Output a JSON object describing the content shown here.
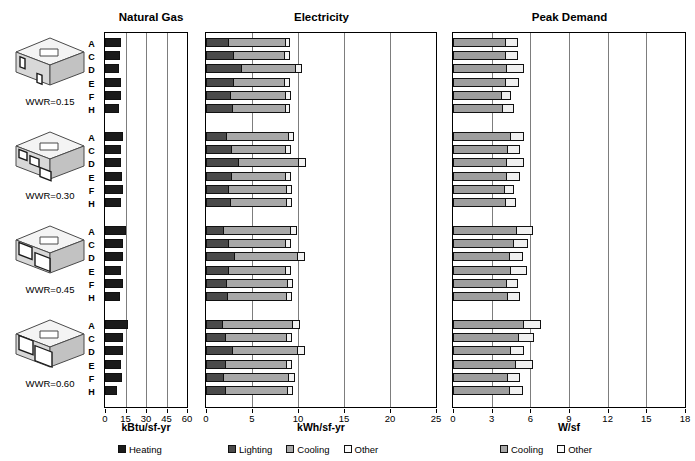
{
  "top_cropped_text": "",
  "panels": [
    {
      "id": "natural_gas",
      "title": "Natural Gas",
      "unit": "kBtu/sf-yr"
    },
    {
      "id": "electricity",
      "title": "Electricity",
      "unit": "kWh/sf-yr"
    },
    {
      "id": "peak_demand",
      "title": "Peak Demand",
      "unit": "W/sf"
    }
  ],
  "row_letters": [
    "A",
    "C",
    "D",
    "E",
    "F",
    "H"
  ],
  "groups": [
    {
      "wwr_label": "WWR=0.15",
      "wwr": 0.15
    },
    {
      "wwr_label": "WWR=0.30",
      "wwr": 0.3
    },
    {
      "wwr_label": "WWR=0.45",
      "wwr": 0.45
    },
    {
      "wwr_label": "WWR=0.60",
      "wwr": 0.6
    }
  ],
  "legends": {
    "natural_gas": [
      {
        "label": "Heating",
        "key": "heating"
      }
    ],
    "electricity": [
      {
        "label": "Lighting",
        "key": "lighting"
      },
      {
        "label": "Cooling",
        "key": "cooling"
      },
      {
        "label": "Other",
        "key": "other"
      }
    ],
    "peak_demand": [
      {
        "label": "Cooling",
        "key": "cooling"
      },
      {
        "label": "Other",
        "key": "other"
      }
    ]
  },
  "chart_data": [
    {
      "type": "bar",
      "orientation": "horizontal",
      "stacked": true,
      "title": "Natural Gas",
      "xlabel": "kBtu/sf-yr",
      "ylabel": "",
      "xlim": [
        0,
        60
      ],
      "xticks": [
        0,
        15,
        30,
        45,
        60
      ],
      "grid": true,
      "legend": [
        "Heating"
      ],
      "legend_position": "bottom",
      "group_labels": [
        "WWR=0.15",
        "WWR=0.30",
        "WWR=0.45",
        "WWR=0.60"
      ],
      "categories": [
        "A",
        "C",
        "D",
        "E",
        "F",
        "H"
      ],
      "series": [
        {
          "name": "Heating",
          "groups": [
            {
              "group": "WWR=0.15",
              "values": [
                11.5,
                11.0,
                10.5,
                11.5,
                11.5,
                10.0
              ]
            },
            {
              "group": "WWR=0.30",
              "values": [
                13.0,
                12.0,
                11.5,
                12.5,
                13.0,
                11.5
              ]
            },
            {
              "group": "WWR=0.45",
              "values": [
                15.5,
                13.5,
                13.0,
                12.0,
                13.5,
                11.0
              ]
            },
            {
              "group": "WWR=0.60",
              "values": [
                16.5,
                13.5,
                13.0,
                12.0,
                12.5,
                9.0
              ]
            }
          ]
        }
      ]
    },
    {
      "type": "bar",
      "orientation": "horizontal",
      "stacked": true,
      "title": "Electricity",
      "xlabel": "kWh/sf-yr",
      "ylabel": "",
      "xlim": [
        0,
        25
      ],
      "xticks": [
        0,
        5,
        10,
        15,
        20,
        25
      ],
      "grid": true,
      "legend": [
        "Lighting",
        "Cooling",
        "Other"
      ],
      "legend_position": "bottom",
      "group_labels": [
        "WWR=0.15",
        "WWR=0.30",
        "WWR=0.45",
        "WWR=0.60"
      ],
      "categories": [
        "A",
        "C",
        "D",
        "E",
        "F",
        "H"
      ],
      "series": [
        {
          "name": "Lighting",
          "groups": [
            {
              "group": "WWR=0.15",
              "values": [
                2.5,
                3.0,
                3.9,
                3.0,
                2.7,
                2.9
              ]
            },
            {
              "group": "WWR=0.30",
              "values": [
                2.3,
                2.8,
                3.6,
                2.8,
                2.5,
                2.7
              ]
            },
            {
              "group": "WWR=0.45",
              "values": [
                2.0,
                2.5,
                3.2,
                2.5,
                2.3,
                2.4
              ]
            },
            {
              "group": "WWR=0.60",
              "values": [
                1.8,
                2.2,
                2.9,
                2.2,
                2.0,
                2.2
              ]
            }
          ]
        },
        {
          "name": "Cooling",
          "groups": [
            {
              "group": "WWR=0.15",
              "values": [
                6.3,
                5.7,
                6.0,
                5.7,
                6.1,
                5.9
              ]
            },
            {
              "group": "WWR=0.30",
              "values": [
                6.8,
                6.0,
                6.6,
                6.0,
                6.4,
                6.2
              ]
            },
            {
              "group": "WWR=0.45",
              "values": [
                7.3,
                6.3,
                6.9,
                6.3,
                6.7,
                6.5
              ]
            },
            {
              "group": "WWR=0.60",
              "values": [
                7.8,
                6.7,
                7.2,
                6.7,
                7.1,
                6.8
              ]
            }
          ]
        },
        {
          "name": "Other",
          "groups": [
            {
              "group": "WWR=0.15",
              "values": [
                0.6,
                0.7,
                0.8,
                0.7,
                0.7,
                0.6
              ]
            },
            {
              "group": "WWR=0.30",
              "values": [
                0.7,
                0.7,
                0.9,
                0.7,
                0.7,
                0.7
              ]
            },
            {
              "group": "WWR=0.45",
              "values": [
                0.8,
                0.7,
                0.9,
                0.7,
                0.7,
                0.7
              ]
            },
            {
              "group": "WWR=0.60",
              "values": [
                0.8,
                0.7,
                0.9,
                0.7,
                0.8,
                0.7
              ]
            }
          ]
        }
      ]
    },
    {
      "type": "bar",
      "orientation": "horizontal",
      "stacked": true,
      "title": "Peak Demand",
      "xlabel": "W/sf",
      "ylabel": "",
      "xlim": [
        0,
        18
      ],
      "xticks": [
        0,
        3,
        6,
        9,
        12,
        15,
        18
      ],
      "grid": true,
      "legend": [
        "Cooling",
        "Other"
      ],
      "legend_position": "bottom",
      "group_labels": [
        "WWR=0.15",
        "WWR=0.30",
        "WWR=0.45",
        "WWR=0.60"
      ],
      "categories": [
        "A",
        "C",
        "D",
        "E",
        "F",
        "H"
      ],
      "series": [
        {
          "name": "Cooling",
          "groups": [
            {
              "group": "WWR=0.15",
              "values": [
                4.1,
                4.1,
                4.2,
                4.1,
                3.8,
                3.9
              ]
            },
            {
              "group": "WWR=0.30",
              "values": [
                4.5,
                4.3,
                4.2,
                4.2,
                4.0,
                4.1
              ]
            },
            {
              "group": "WWR=0.45",
              "values": [
                5.0,
                4.7,
                4.4,
                4.5,
                4.2,
                4.3
              ]
            },
            {
              "group": "WWR=0.60",
              "values": [
                5.5,
                5.1,
                4.5,
                4.9,
                4.3,
                4.4
              ]
            }
          ]
        },
        {
          "name": "Other",
          "groups": [
            {
              "group": "WWR=0.15",
              "values": [
                1.0,
                1.0,
                1.4,
                1.1,
                0.8,
                0.9
              ]
            },
            {
              "group": "WWR=0.30",
              "values": [
                1.1,
                1.0,
                1.4,
                1.1,
                0.8,
                0.9
              ]
            },
            {
              "group": "WWR=0.45",
              "values": [
                1.3,
                1.2,
                1.1,
                1.3,
                0.9,
                1.0
              ]
            },
            {
              "group": "WWR=0.60",
              "values": [
                1.4,
                1.3,
                1.1,
                1.4,
                1.0,
                1.1
              ]
            }
          ]
        }
      ]
    }
  ]
}
